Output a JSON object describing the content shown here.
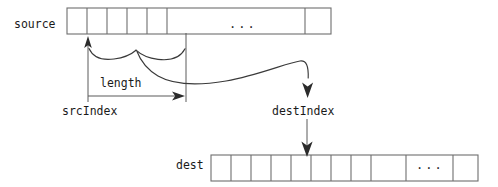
{
  "figure": {
    "title_hidden": "",
    "stroke_color": "#3a3a3a",
    "text_color": "#1a1a1a",
    "background": "#ffffff"
  },
  "labels": {
    "source": "source",
    "dest": "dest",
    "length": "length",
    "src_index": "srcIndex",
    "dest_index": "destIndex",
    "source_ellipsis": "...",
    "dest_ellipsis": "..."
  },
  "arrays": {
    "source": {
      "name": "source",
      "x": 67,
      "y": 8,
      "width": 264,
      "height": 26,
      "dividers": [
        87,
        107,
        127,
        147,
        167,
        305
      ],
      "ellipsis_center_x": 236,
      "cells": [
        {
          "index": 0,
          "value": ""
        },
        {
          "index": 1,
          "value": ""
        },
        {
          "index": 2,
          "value": ""
        },
        {
          "index": 3,
          "value": ""
        },
        {
          "index": 4,
          "value": ""
        },
        {
          "index": 5,
          "value": "..."
        },
        {
          "index": 6,
          "value": ""
        }
      ]
    },
    "dest": {
      "name": "dest",
      "x": 211,
      "y": 155,
      "width": 267,
      "height": 26,
      "dividers": [
        231,
        251,
        271,
        291,
        311,
        331,
        351,
        371,
        406,
        453
      ],
      "ellipsis_center_x": 429,
      "cells": [
        {
          "index": 0,
          "value": ""
        },
        {
          "index": 1,
          "value": ""
        },
        {
          "index": 2,
          "value": ""
        },
        {
          "index": 3,
          "value": ""
        },
        {
          "index": 4,
          "value": ""
        },
        {
          "index": 5,
          "value": ""
        },
        {
          "index": 6,
          "value": ""
        },
        {
          "index": 7,
          "value": ""
        },
        {
          "index": 8,
          "value": ""
        },
        {
          "index": 9,
          "value": "..."
        },
        {
          "index": 10,
          "value": ""
        }
      ]
    }
  },
  "annotations": {
    "src_index_marker_x": 88,
    "src_index_guide_top": 38,
    "src_index_guide_bottom": 102,
    "length_right_guide_x": 186,
    "length_right_guide_top": 33,
    "length_right_guide_bottom": 102,
    "length_arrow_y": 96,
    "dest_index_marker_x": 307,
    "dest_index_arrow_top_y": 86,
    "dest_index_arrow_bottom_y": 153,
    "brace_left_x": 88,
    "brace_right_x": 186,
    "brace_y": 50
  }
}
